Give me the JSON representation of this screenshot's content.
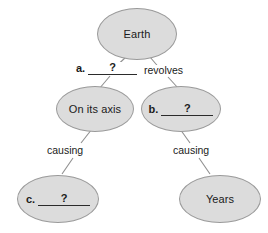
{
  "diagram": {
    "type": "concept-map",
    "background_color": "#ffffff",
    "node_fill_color": "#dcdcdc",
    "node_border_color": "#9a9a9a",
    "line_color": "#8f8f8f",
    "text_color": "#1a1a1a",
    "nodes": [
      {
        "id": "earth",
        "kind": "text",
        "label": "Earth",
        "x": 97,
        "y": 8,
        "w": 80,
        "h": 52
      },
      {
        "id": "on-its-axis",
        "kind": "text",
        "label": "On its axis",
        "x": 56,
        "y": 86,
        "w": 78,
        "h": 46
      },
      {
        "id": "blank-b",
        "kind": "blank",
        "letter": "b.",
        "placeholder": "?",
        "label": "b. ?",
        "x": 141,
        "y": 86,
        "w": 80,
        "h": 46
      },
      {
        "id": "blank-c",
        "kind": "blank",
        "letter": "c.",
        "placeholder": "?",
        "label": "c. ?",
        "x": 17,
        "y": 175,
        "w": 82,
        "h": 48
      },
      {
        "id": "years",
        "kind": "text",
        "label": "Years",
        "x": 179,
        "y": 175,
        "w": 82,
        "h": 48
      }
    ],
    "edges": [
      {
        "id": "earth-to-axis",
        "from": "earth",
        "to": "on-its-axis",
        "kind": "blank",
        "letter": "a.",
        "placeholder": "?",
        "label": "a. ?"
      },
      {
        "id": "earth-to-b",
        "from": "earth",
        "to": "blank-b",
        "kind": "text",
        "label": "revolves"
      },
      {
        "id": "axis-to-c",
        "from": "on-its-axis",
        "to": "blank-c",
        "kind": "text",
        "label": "causing"
      },
      {
        "id": "b-to-years",
        "from": "blank-b",
        "to": "years",
        "kind": "text",
        "label": "causing"
      }
    ]
  }
}
